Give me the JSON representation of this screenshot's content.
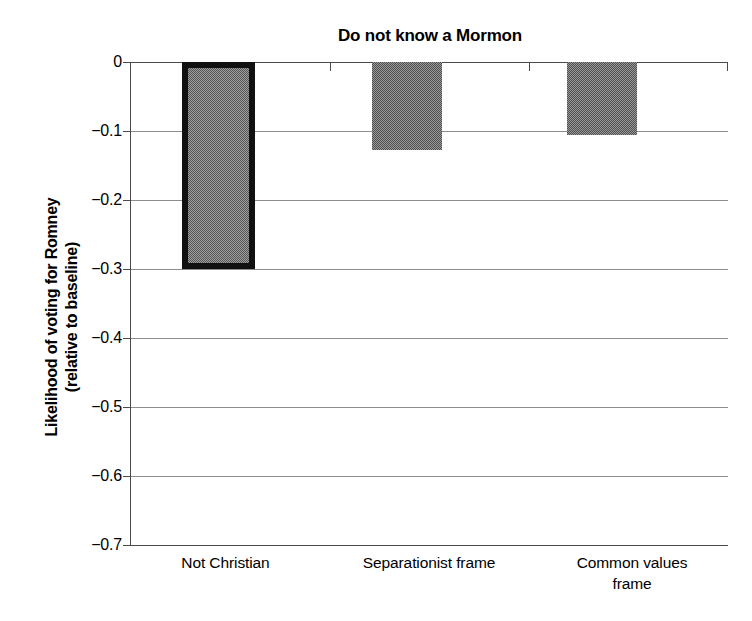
{
  "chart_data": {
    "type": "bar",
    "title": "Do not know a Mormon",
    "xlabel": "",
    "ylabel_lines": [
      "Likelihood of voting for Romney",
      "(relative to baseline)"
    ],
    "ylabel": "Likelihood of voting for Romney (relative to baseline)",
    "categories": [
      "Not Christian",
      "Separationist frame",
      "Common values frame"
    ],
    "category_lines": [
      [
        "Not Christian"
      ],
      [
        "Separationist frame"
      ],
      [
        "Common values",
        "frame"
      ]
    ],
    "values": [
      -0.3,
      -0.127,
      -0.105
    ],
    "ylim": [
      -0.7,
      0
    ],
    "ytick_labels": [
      "0",
      "−0.1",
      "−0.2",
      "−0.3",
      "−0.4",
      "−0.5",
      "−0.6",
      "−0.7"
    ],
    "ytick_values": [
      0,
      -0.1,
      -0.2,
      -0.3,
      -0.4,
      -0.5,
      -0.6,
      -0.7
    ],
    "grid": true,
    "legend": "none",
    "highlighted_index": 0,
    "bar_fill_color": "#6d6d6d",
    "highlight_border_color": "#111111",
    "gridline_color": "#8d8d8d",
    "axis_color": "#4a4a4a",
    "background_color": "#ffffff"
  }
}
